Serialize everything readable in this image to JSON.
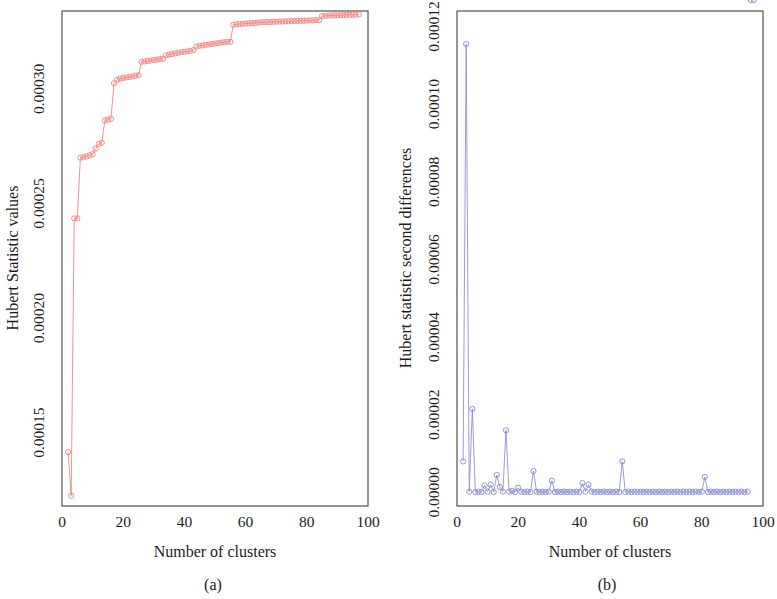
{
  "figure": {
    "panels": [
      {
        "id": "a",
        "caption": "(a)",
        "xlabel": "Number of clusters",
        "ylabel": "Hubert Statistic values"
      },
      {
        "id": "b",
        "caption": "(b)",
        "xlabel": "Number of clusters",
        "ylabel": "Hubert statistic second differences"
      }
    ]
  },
  "chart_data": [
    {
      "type": "line",
      "id": "panel-a",
      "title": "",
      "xlabel": "Number of clusters",
      "ylabel": "Hubert Statistic values",
      "xlim": [
        0,
        100
      ],
      "ylim": [
        0.000118,
        0.000334
      ],
      "xticks": [
        0,
        20,
        40,
        60,
        80,
        100
      ],
      "xtick_labels": [
        "0",
        "20",
        "40",
        "60",
        "80",
        "100"
      ],
      "yticks": [
        0.00015,
        0.0002,
        0.00025,
        0.0003
      ],
      "ytick_labels": [
        "0.00015",
        "0.00020",
        "0.00025",
        "0.00030"
      ],
      "grid": false,
      "legend": null,
      "marker": "open-circle",
      "color": "#f08080",
      "x": [
        2,
        3,
        4,
        5,
        6,
        7,
        8,
        9,
        10,
        11,
        12,
        13,
        14,
        15,
        16,
        17,
        18,
        19,
        20,
        21,
        22,
        23,
        24,
        25,
        26,
        27,
        28,
        29,
        30,
        31,
        32,
        33,
        34,
        35,
        36,
        37,
        38,
        39,
        40,
        41,
        42,
        43,
        44,
        45,
        46,
        47,
        48,
        49,
        50,
        51,
        52,
        53,
        54,
        55,
        56,
        57,
        58,
        59,
        60,
        61,
        62,
        63,
        64,
        65,
        66,
        67,
        68,
        69,
        70,
        71,
        72,
        73,
        74,
        75,
        76,
        77,
        78,
        79,
        80,
        81,
        82,
        83,
        84,
        85,
        86,
        87,
        88,
        89,
        90,
        91,
        92,
        93,
        94,
        95,
        96,
        97
      ],
      "y": [
        0.0001415,
        0.0001225,
        0.0002435,
        0.0002435,
        0.00027,
        0.0002702,
        0.0002705,
        0.000271,
        0.0002715,
        0.000274,
        0.000276,
        0.0002765,
        0.0002862,
        0.0002866,
        0.000287,
        0.0003025,
        0.000304,
        0.0003045,
        0.0003048,
        0.000305,
        0.0003052,
        0.0003055,
        0.0003058,
        0.000306,
        0.0003118,
        0.000312,
        0.0003122,
        0.0003124,
        0.0003126,
        0.0003128,
        0.000313,
        0.0003132,
        0.0003146,
        0.000315,
        0.0003152,
        0.0003155,
        0.0003158,
        0.000316,
        0.0003162,
        0.0003164,
        0.0003166,
        0.000317,
        0.0003185,
        0.0003188,
        0.000319,
        0.0003192,
        0.0003194,
        0.0003196,
        0.0003198,
        0.00032,
        0.0003202,
        0.0003204,
        0.0003205,
        0.0003206,
        0.000328,
        0.0003282,
        0.0003283,
        0.0003284,
        0.0003285,
        0.0003286,
        0.0003287,
        0.0003288,
        0.0003289,
        0.000329,
        0.0003291,
        0.0003292,
        0.0003292,
        0.0003293,
        0.0003293,
        0.0003294,
        0.0003294,
        0.0003295,
        0.0003295,
        0.0003296,
        0.0003296,
        0.0003297,
        0.0003297,
        0.0003298,
        0.0003298,
        0.0003299,
        0.0003299,
        0.00033,
        0.00033,
        0.0003318,
        0.0003319,
        0.000332,
        0.000332,
        0.0003321,
        0.0003321,
        0.0003322,
        0.0003322,
        0.0003323,
        0.0003323,
        0.0003324,
        0.0003324,
        0.0003325
      ]
    },
    {
      "type": "line",
      "id": "panel-b",
      "title": "",
      "xlabel": "Number of clusters",
      "ylabel": "Hubert statistic second differences",
      "xlim": [
        0,
        100
      ],
      "ylim": [
        -3.5e-06,
        0.000124
      ],
      "xticks": [
        0,
        20,
        40,
        60,
        80,
        100
      ],
      "xtick_labels": [
        "0",
        "20",
        "40",
        "60",
        "80",
        "100"
      ],
      "yticks": [
        0.0,
        2e-05,
        4e-05,
        6e-05,
        8e-05,
        0.0001,
        0.00012
      ],
      "ytick_labels": [
        "0.00000",
        "0.00002",
        "0.00004",
        "0.00006",
        "0.00008",
        "0.00010",
        "0.00012"
      ],
      "grid": false,
      "legend": null,
      "marker": "open-circle",
      "color": "#8a8ad0",
      "x": [
        2,
        3,
        4,
        5,
        6,
        7,
        8,
        9,
        10,
        11,
        12,
        13,
        14,
        15,
        16,
        17,
        18,
        19,
        20,
        21,
        22,
        23,
        24,
        25,
        26,
        27,
        28,
        29,
        30,
        31,
        32,
        33,
        34,
        35,
        36,
        37,
        38,
        39,
        40,
        41,
        42,
        43,
        44,
        45,
        46,
        47,
        48,
        49,
        50,
        51,
        52,
        53,
        54,
        55,
        56,
        57,
        58,
        59,
        60,
        61,
        62,
        63,
        64,
        65,
        66,
        67,
        68,
        69,
        70,
        71,
        72,
        73,
        74,
        75,
        76,
        77,
        78,
        79,
        80,
        81,
        82,
        83,
        84,
        85,
        86,
        87,
        88,
        89,
        90,
        91,
        92,
        93,
        94,
        95,
        96,
        97
      ],
      "y": [
        8e-06,
        0.0001155,
        2e-07,
        2.15e-05,
        1e-07,
        2e-07,
        1e-07,
        1.8e-06,
        2e-07,
        2e-06,
        1e-07,
        4.5e-06,
        1.4e-06,
        2e-07,
        1.6e-05,
        2e-07,
        4e-07,
        1e-07,
        1.2e-06,
        2e-07,
        1e-07,
        2e-07,
        1e-07,
        5.5e-06,
        2e-07,
        1e-07,
        2e-07,
        1e-07,
        2e-07,
        3e-06,
        1e-07,
        2e-07,
        1e-07,
        2e-07,
        1e-07,
        2e-07,
        1e-07,
        2e-07,
        1e-07,
        2.4e-06,
        2e-07,
        2e-06,
        2e-07,
        1e-07,
        2e-07,
        1e-07,
        2e-07,
        1e-07,
        2e-07,
        1e-07,
        2e-07,
        1e-07,
        8e-06,
        1e-07,
        2e-07,
        1e-07,
        2e-07,
        1e-07,
        2e-07,
        1e-07,
        2e-07,
        1e-07,
        2e-07,
        1e-07,
        2e-07,
        1e-07,
        2e-07,
        1e-07,
        2e-07,
        1e-07,
        2e-07,
        1e-07,
        2e-07,
        1e-07,
        2e-07,
        1e-07,
        2e-07,
        1e-07,
        2e-07,
        4e-06,
        1e-07,
        2e-07,
        1e-07,
        2e-07,
        1e-07,
        2e-07,
        1e-07,
        2e-07,
        1e-07,
        2e-07,
        1e-07,
        2e-07,
        1e-07,
        2e-07
      ]
    }
  ]
}
